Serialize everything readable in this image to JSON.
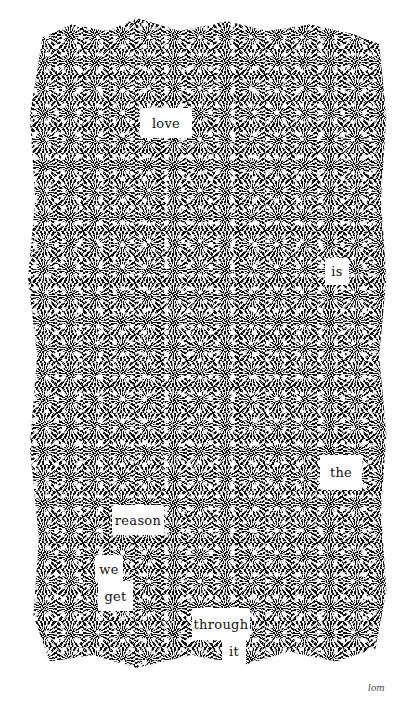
{
  "artwork": {
    "type": "blackout poem",
    "background_color": "#ffffff",
    "ink_color": "#111111",
    "words": [
      {
        "text": "love",
        "x": 140,
        "y": 108,
        "w": 52,
        "h": 30
      },
      {
        "text": "is",
        "x": 325,
        "y": 258,
        "w": 24,
        "h": 27
      },
      {
        "text": "the",
        "x": 320,
        "y": 455,
        "w": 42,
        "h": 35
      },
      {
        "text": "reason",
        "x": 112,
        "y": 505,
        "w": 52,
        "h": 30
      },
      {
        "text": "we",
        "x": 95,
        "y": 555,
        "w": 28,
        "h": 26
      },
      {
        "text": "get",
        "x": 98,
        "y": 581,
        "w": 35,
        "h": 30
      },
      {
        "text": "through",
        "x": 192,
        "y": 608,
        "w": 58,
        "h": 32
      },
      {
        "text": "it",
        "x": 222,
        "y": 638,
        "w": 24,
        "h": 27
      }
    ],
    "poem": "love is the reason we get through it",
    "signature": "lom"
  }
}
